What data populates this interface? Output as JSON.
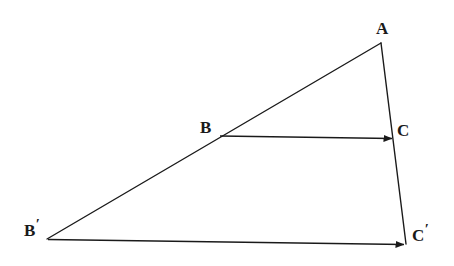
{
  "figure": {
    "background_color": "#ffffff",
    "stroke_color": "#1a1a1a",
    "stroke_width": 1.4,
    "width": 454,
    "height": 266,
    "points": {
      "A": {
        "label": "A",
        "prime": "",
        "x": 381,
        "y": 43
      },
      "B": {
        "label": "B",
        "prime": "",
        "x": 219,
        "y": 135
      },
      "C": {
        "label": "C",
        "prime": "",
        "x": 393,
        "y": 138
      },
      "Bp": {
        "label": "B",
        "prime": "′",
        "x": 47,
        "y": 239
      },
      "Cp": {
        "label": "C",
        "prime": "′",
        "x": 406,
        "y": 244
      }
    },
    "segments": [
      {
        "name": "A-to-Bprime",
        "from": "A",
        "to": "Bp",
        "arrow": false
      },
      {
        "name": "A-to-Cprime",
        "from": "A",
        "to": "Cp",
        "arrow": false
      }
    ],
    "vectors": [
      {
        "name": "vector-B-to-C",
        "from": "B",
        "to": "C",
        "arrow": true
      },
      {
        "name": "vector-Bprime-to-Cprime",
        "from": "Bp",
        "to": "Cp",
        "arrow": true
      }
    ]
  }
}
